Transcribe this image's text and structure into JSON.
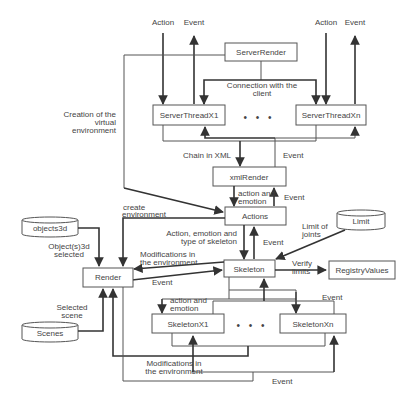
{
  "diagram": {
    "nodes": {
      "server_render": "ServerRender",
      "server_thread_x1": "ServerThreadX1",
      "server_thread_xn": "ServerThreadXn",
      "xml_render": "xmlRender",
      "actions": "Actions",
      "skeleton": "Skeleton",
      "registry_values": "RegistryValues",
      "render": "Render",
      "skeleton_x1": "SkeletonX1",
      "skeleton_xn": "SkeletonXn",
      "objects3d": "objects3d",
      "limit": "Limit",
      "scenes": "Scenes"
    },
    "ellipsis": "• • •",
    "labels": {
      "action_1": "Action",
      "event_1": "Event",
      "action_2": "Action",
      "event_2": "Event",
      "connection_line1": "Connection with the",
      "connection_line2": "client",
      "creation_line1": "Creation of the",
      "creation_line2": "virtual",
      "creation_line3": "environment",
      "chain_xml": "Chain in XML",
      "event_xml": "Event",
      "action_emotion_line1": "action and",
      "action_emotion_line2": "emotion",
      "event_actions": "Event",
      "create_env_line1": "create",
      "create_env_line2": "environment",
      "action_emotion_type_line1": "Action, emotion and",
      "action_emotion_type_line2": "type of skeleton",
      "event_skeleton": "Event",
      "limit_joints_line1": "Limit of",
      "limit_joints_line2": "joints",
      "objects_selected_line1": "Object(s)3d",
      "objects_selected_line2": "selected",
      "modifications_line1": "Modifications in",
      "modifications_line2": "the environment",
      "event_render": "Event",
      "verify_line1": "Verify",
      "verify_line2": "limits",
      "skel_action_emotion_line1": "action and",
      "skel_action_emotion_line2": "emotion",
      "event_skel_xn": "Event",
      "selected_scene_line1": "Selected",
      "selected_scene_line2": "scene",
      "modifications_bottom_line1": "Modifications in",
      "modifications_bottom_line2": "the environment",
      "event_bottom": "Event"
    }
  }
}
